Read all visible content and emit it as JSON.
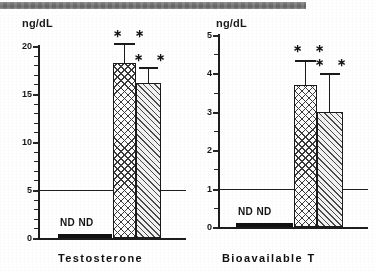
{
  "figure": {
    "scan_artifact": {
      "name": "scan-shadow-bar",
      "left": 0,
      "width": 306,
      "color": "#6f6f6f"
    }
  },
  "chart_data": [
    {
      "type": "bar",
      "title": "",
      "xlabel": "Testosterone",
      "ylabel": "ng/dL",
      "ylim": [
        0,
        20
      ],
      "yticks": [
        0,
        5,
        10,
        15,
        20
      ],
      "yticklabels": [
        "0",
        "5",
        "10",
        "15",
        "20"
      ],
      "yminor_ticks": [
        1,
        2,
        3,
        4,
        6,
        7,
        8,
        9,
        11,
        12,
        13,
        14,
        16,
        17,
        18,
        19
      ],
      "grid": false,
      "legend": "none",
      "reference_line": {
        "value": 5,
        "label": ""
      },
      "categories": [
        "ND",
        "ND",
        "group3",
        "group4"
      ],
      "values": [
        0,
        0,
        18.2,
        16.1
      ],
      "errors": [
        0,
        0,
        2.1,
        1.7
      ],
      "annotations": [
        "ND",
        "ND",
        "* *",
        "* *"
      ],
      "bar_patterns": [
        "none",
        "none",
        "crosshatch",
        "diagonal"
      ],
      "nd_labels": [
        "ND",
        "ND"
      ]
    },
    {
      "type": "bar",
      "title": "",
      "xlabel": "Bioavailable  T",
      "ylabel": "ng/dL",
      "ylim": [
        0,
        5
      ],
      "yticks": [
        0,
        1,
        2,
        3,
        4,
        5
      ],
      "yticklabels": [
        "0",
        "1",
        "2",
        "3",
        "4",
        "5"
      ],
      "yminor_ticks": [
        0.5,
        1.5,
        2.5,
        3.5,
        4.5
      ],
      "grid": false,
      "legend": "none",
      "reference_line": {
        "value": 1,
        "label": ""
      },
      "categories": [
        "ND",
        "ND",
        "group3",
        "group4"
      ],
      "values": [
        0,
        0,
        3.7,
        3.0
      ],
      "errors": [
        0,
        0,
        0.65,
        1.0
      ],
      "annotations": [
        "ND",
        "ND",
        "* *",
        "* *"
      ],
      "bar_patterns": [
        "none",
        "none",
        "crosshatch",
        "diagonal"
      ],
      "nd_labels": [
        "ND",
        "ND"
      ]
    }
  ],
  "panels": {
    "left": {
      "unit_label": "ng/dL",
      "x_title": "Testosterone",
      "nd_text": "ND ND",
      "stars_bar3": "∗ ∗",
      "stars_bar4": "∗ ∗",
      "ticklabels": [
        "20",
        "15",
        "10",
        "5",
        "0"
      ]
    },
    "right": {
      "unit_label": "ng/dL",
      "x_title": "Bioavailable  T",
      "nd_text": "ND  ND",
      "stars_bar3": "∗ ∗",
      "stars_bar4": "∗ ∗",
      "ticklabels": [
        "5",
        "4",
        "3",
        "2",
        "1",
        "0"
      ]
    }
  }
}
